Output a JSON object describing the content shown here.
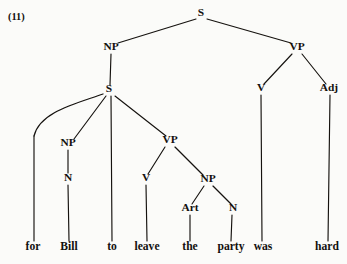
{
  "figure": {
    "example_number": "(11)",
    "sentence": "for Bill to leave the party was hard",
    "width": 347,
    "height": 264,
    "ink_color": "#15120f",
    "background_color": "#fbfbf9"
  },
  "nodes": [
    {
      "id": "s-root",
      "label": "S",
      "x": 201,
      "y": 16
    },
    {
      "id": "np-subject",
      "label": "NP",
      "x": 111,
      "y": 50
    },
    {
      "id": "vp-main",
      "label": "VP",
      "x": 297,
      "y": 50
    },
    {
      "id": "s-embedded",
      "label": "S",
      "x": 109,
      "y": 92
    },
    {
      "id": "v-main",
      "label": "V",
      "x": 261,
      "y": 91
    },
    {
      "id": "adj-main",
      "label": "Adj",
      "x": 329,
      "y": 91
    },
    {
      "id": "np-bill",
      "label": "NP",
      "x": 68,
      "y": 146
    },
    {
      "id": "vp-embedded",
      "label": "VP",
      "x": 170,
      "y": 143
    },
    {
      "id": "n-bill",
      "label": "N",
      "x": 68,
      "y": 181
    },
    {
      "id": "v-leave",
      "label": "V",
      "x": 146,
      "y": 181
    },
    {
      "id": "np-object",
      "label": "NP",
      "x": 208,
      "y": 182
    },
    {
      "id": "art-the",
      "label": "Art",
      "x": 190,
      "y": 211
    },
    {
      "id": "n-party",
      "label": "N",
      "x": 233,
      "y": 211
    }
  ],
  "leaves": [
    {
      "id": "leaf-for",
      "label": "for",
      "x": 33,
      "y": 250
    },
    {
      "id": "leaf-bill",
      "label": "Bill",
      "x": 69,
      "y": 250
    },
    {
      "id": "leaf-to",
      "label": "to",
      "x": 112,
      "y": 250
    },
    {
      "id": "leaf-leave",
      "label": "leave",
      "x": 147,
      "y": 250
    },
    {
      "id": "leaf-the",
      "label": "the",
      "x": 190,
      "y": 250
    },
    {
      "id": "leaf-party",
      "label": "party",
      "x": 231,
      "y": 250
    },
    {
      "id": "leaf-was",
      "label": "was",
      "x": 263,
      "y": 250
    },
    {
      "id": "leaf-hard",
      "label": "hard",
      "x": 327,
      "y": 250
    }
  ],
  "edges": [
    {
      "id": "edge-s-np",
      "from": "s-root",
      "to": "np-subject",
      "d": "M 196 19 L 118 43"
    },
    {
      "id": "edge-s-vp",
      "from": "s-root",
      "to": "vp-main",
      "d": "M 207 19 L 291 43"
    },
    {
      "id": "edge-np-s",
      "from": "np-subject",
      "to": "s-embedded",
      "d": "M 111 54 L 110 85"
    },
    {
      "id": "edge-vp-v",
      "from": "vp-main",
      "to": "v-main",
      "d": "M 292 54 L 264 84"
    },
    {
      "id": "edge-vp-adj",
      "from": "vp-main",
      "to": "adj-main",
      "d": "M 302 54 L 326 84"
    },
    {
      "id": "edge-s-for-curve",
      "from": "s-embedded",
      "to": "leaf-for",
      "d": "M 103 94 C 75 104, 40 112, 34 136"
    },
    {
      "id": "edge-s-np-bill",
      "from": "s-embedded",
      "to": "np-bill",
      "d": "M 106 96 L 74 139"
    },
    {
      "id": "edge-s-to",
      "from": "s-embedded",
      "to": "leaf-to",
      "d": "M 111 96 L 112 241"
    },
    {
      "id": "edge-s-vp-emb",
      "from": "s-embedded",
      "to": "vp-embedded",
      "d": "M 115 96 L 166 136"
    },
    {
      "id": "edge-np-n-bill",
      "from": "np-bill",
      "to": "n-bill",
      "d": "M 68 150 L 68 173"
    },
    {
      "id": "edge-n-for",
      "from": "edge-s-for-curve",
      "to": "leaf-for",
      "d": "M 34 136 L 34 241"
    },
    {
      "id": "edge-n-bill",
      "from": "n-bill",
      "to": "leaf-bill",
      "d": "M 68 185 L 69 241"
    },
    {
      "id": "edge-vp-v-leave",
      "from": "vp-embedded",
      "to": "v-leave",
      "d": "M 165 147 L 148 174"
    },
    {
      "id": "edge-vp-np-obj",
      "from": "vp-embedded",
      "to": "np-object",
      "d": "M 175 147 L 203 175"
    },
    {
      "id": "edge-v-leave",
      "from": "v-leave",
      "to": "leaf-leave",
      "d": "M 146 185 L 147 241"
    },
    {
      "id": "edge-np-art",
      "from": "np-object",
      "to": "art-the",
      "d": "M 204 186 L 192 204"
    },
    {
      "id": "edge-np-n-party",
      "from": "np-object",
      "to": "n-party",
      "d": "M 213 186 L 231 204"
    },
    {
      "id": "edge-art-the",
      "from": "art-the",
      "to": "leaf-the",
      "d": "M 190 215 L 190 241"
    },
    {
      "id": "edge-n-party",
      "from": "n-party",
      "to": "leaf-party",
      "d": "M 232 215 L 231 241"
    },
    {
      "id": "edge-v-was",
      "from": "v-main",
      "to": "leaf-was",
      "d": "M 261 95 L 262 241"
    },
    {
      "id": "edge-adj-hard",
      "from": "adj-main",
      "to": "leaf-hard",
      "d": "M 330 95 L 328 241"
    }
  ]
}
